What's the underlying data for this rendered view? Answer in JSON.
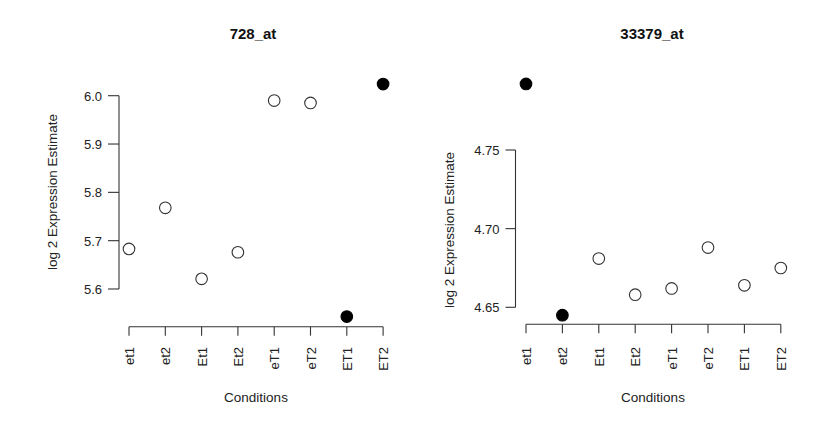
{
  "chart_data": [
    {
      "type": "scatter",
      "title": "728_at",
      "xlabel": "Conditions",
      "ylabel": "log 2 Expression Estimate",
      "categories": [
        "et1",
        "et2",
        "Et1",
        "Et2",
        "eT1",
        "eT2",
        "ET1",
        "ET2"
      ],
      "values": [
        5.683,
        5.768,
        5.621,
        5.676,
        5.99,
        5.985,
        5.543,
        6.024
      ],
      "filled": [
        false,
        false,
        false,
        false,
        false,
        false,
        true,
        true
      ],
      "yticks": [
        5.6,
        5.7,
        5.8,
        5.9,
        6.0
      ],
      "ytick_labels": [
        "5.6",
        "5.7",
        "5.8",
        "5.9",
        "6.0"
      ],
      "ylim": [
        5.6,
        6.0
      ],
      "grid": false,
      "legend": null
    },
    {
      "type": "scatter",
      "title": "33379_at",
      "xlabel": "Conditions",
      "ylabel": "log 2 Expression Estimate",
      "categories": [
        "et1",
        "et2",
        "Et1",
        "Et2",
        "eT1",
        "eT2",
        "ET1",
        "ET2"
      ],
      "values": [
        4.792,
        4.645,
        4.681,
        4.658,
        4.662,
        4.688,
        4.664,
        4.675
      ],
      "filled": [
        true,
        true,
        false,
        false,
        false,
        false,
        false,
        false
      ],
      "yticks": [
        4.65,
        4.7,
        4.75
      ],
      "ytick_labels": [
        "4.65",
        "4.70",
        "4.75"
      ],
      "ylim": [
        4.65,
        4.75
      ],
      "grid": false,
      "legend": null
    }
  ],
  "colors": {
    "marker_stroke": "#333333",
    "marker_fill_solid": "#000000",
    "axis": "#333333",
    "text": "#222222"
  }
}
